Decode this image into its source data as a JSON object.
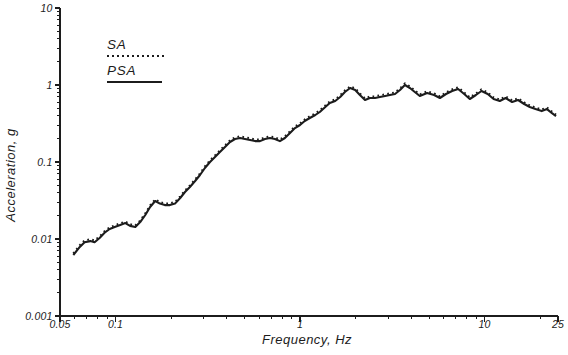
{
  "colors": {
    "ink": "#1c1c1c",
    "background": "#ffffff"
  },
  "axes": {
    "x": {
      "title": "Frequency, Hz",
      "scale": "log",
      "major_ticks": [
        0.05,
        0.1,
        1,
        10,
        25
      ],
      "major_tick_labels": [
        "0.05",
        "0.1",
        "1",
        "10",
        "25"
      ],
      "minor_ticks": [
        0.06,
        0.07,
        0.08,
        0.09,
        0.2,
        0.3,
        0.4,
        0.5,
        0.6,
        0.7,
        0.8,
        0.9,
        2,
        3,
        4,
        5,
        6,
        7,
        8,
        9,
        20
      ]
    },
    "y": {
      "title": "Acceleration, g",
      "scale": "log",
      "major_ticks": [
        0.001,
        0.01,
        0.1,
        1,
        10
      ],
      "major_tick_labels": [
        "0.001",
        "0.01",
        "0.1",
        "1",
        "10"
      ],
      "minor_ticks": [
        0.002,
        0.003,
        0.004,
        0.005,
        0.006,
        0.007,
        0.008,
        0.009,
        0.02,
        0.03,
        0.04,
        0.05,
        0.06,
        0.07,
        0.08,
        0.09,
        0.2,
        0.3,
        0.4,
        0.5,
        0.6,
        0.7,
        0.8,
        0.9,
        2,
        3,
        4,
        5,
        6,
        7,
        8,
        9
      ]
    }
  },
  "chart_data": {
    "type": "line",
    "title": "",
    "xlabel": "Frequency, Hz",
    "ylabel": "Acceleration, g",
    "xscale": "log",
    "yscale": "log",
    "xlim": [
      0.05,
      25
    ],
    "ylim": [
      0.001,
      10
    ],
    "grid": false,
    "legend_position": "upper-left",
    "x": [
      0.059,
      0.064,
      0.068,
      0.073,
      0.077,
      0.082,
      0.088,
      0.093,
      0.099,
      0.106,
      0.113,
      0.12,
      0.128,
      0.136,
      0.145,
      0.154,
      0.164,
      0.174,
      0.185,
      0.197,
      0.21,
      0.224,
      0.238,
      0.253,
      0.27,
      0.287,
      0.305,
      0.325,
      0.346,
      0.368,
      0.392,
      0.417,
      0.444,
      0.473,
      0.503,
      0.536,
      0.57,
      0.607,
      0.646,
      0.687,
      0.731,
      0.778,
      0.828,
      0.882,
      0.939,
      1.0,
      1.06,
      1.13,
      1.21,
      1.28,
      1.37,
      1.45,
      1.55,
      1.65,
      1.75,
      1.87,
      1.99,
      2.11,
      2.25,
      2.39,
      2.55,
      2.71,
      2.89,
      3.07,
      3.27,
      3.48,
      3.7,
      3.94,
      4.19,
      4.46,
      4.88,
      5.33,
      5.73,
      6.18,
      6.67,
      7.19,
      7.76,
      8.32,
      8.98,
      9.63,
      10.4,
      11.2,
      12.1,
      13.0,
      14.1,
      15.2,
      16.4,
      17.6,
      18.9,
      20.4,
      21.8,
      23.2,
      24.4
    ],
    "series": [
      {
        "name": "SA",
        "line_style": "dotted",
        "values": [
          0.0065,
          0.0083,
          0.0096,
          0.0099,
          0.0096,
          0.0108,
          0.0129,
          0.0142,
          0.015,
          0.016,
          0.0169,
          0.0155,
          0.015,
          0.0174,
          0.0215,
          0.0273,
          0.0328,
          0.0302,
          0.029,
          0.029,
          0.0302,
          0.0358,
          0.0428,
          0.0497,
          0.0594,
          0.0712,
          0.0878,
          0.105,
          0.122,
          0.142,
          0.165,
          0.191,
          0.209,
          0.215,
          0.209,
          0.203,
          0.196,
          0.196,
          0.209,
          0.215,
          0.209,
          0.196,
          0.215,
          0.25,
          0.29,
          0.317,
          0.358,
          0.392,
          0.428,
          0.468,
          0.544,
          0.612,
          0.651,
          0.734,
          0.852,
          0.96,
          0.904,
          0.778,
          0.67,
          0.712,
          0.712,
          0.734,
          0.756,
          0.778,
          0.802,
          0.904,
          1.05,
          0.96,
          0.852,
          0.756,
          0.826,
          0.778,
          0.712,
          0.802,
          0.878,
          0.931,
          0.802,
          0.691,
          0.778,
          0.878,
          0.802,
          0.691,
          0.651,
          0.712,
          0.632,
          0.67,
          0.594,
          0.544,
          0.511,
          0.481,
          0.511,
          0.452,
          0.413
        ]
      },
      {
        "name": "PSA",
        "line_style": "solid",
        "values": [
          0.0062,
          0.0079,
          0.0091,
          0.0094,
          0.0091,
          0.0103,
          0.0123,
          0.0135,
          0.0143,
          0.0152,
          0.0161,
          0.0148,
          0.0143,
          0.0166,
          0.0205,
          0.026,
          0.0312,
          0.0288,
          0.0276,
          0.0276,
          0.0288,
          0.0341,
          0.0408,
          0.0473,
          0.0566,
          0.0678,
          0.0836,
          0.1,
          0.116,
          0.135,
          0.157,
          0.182,
          0.199,
          0.205,
          0.199,
          0.193,
          0.187,
          0.187,
          0.199,
          0.205,
          0.199,
          0.187,
          0.205,
          0.238,
          0.276,
          0.302,
          0.341,
          0.373,
          0.408,
          0.446,
          0.518,
          0.583,
          0.62,
          0.699,
          0.811,
          0.914,
          0.861,
          0.741,
          0.638,
          0.678,
          0.678,
          0.699,
          0.72,
          0.741,
          0.764,
          0.861,
          1.0,
          0.914,
          0.811,
          0.72,
          0.787,
          0.741,
          0.678,
          0.764,
          0.836,
          0.887,
          0.764,
          0.658,
          0.741,
          0.836,
          0.764,
          0.658,
          0.62,
          0.678,
          0.602,
          0.638,
          0.566,
          0.518,
          0.487,
          0.458,
          0.487,
          0.43,
          0.393
        ]
      }
    ]
  }
}
